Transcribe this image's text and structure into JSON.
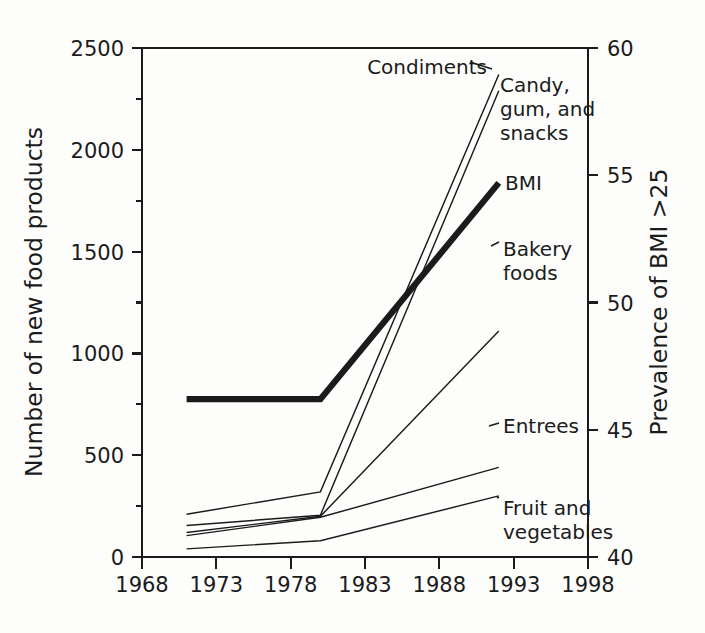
{
  "chart_data": {
    "type": "line",
    "title": "",
    "xlabel": "",
    "ylabel": "Number of new food products",
    "y2label": "Prevalence of BMI >25",
    "xlim": [
      1968,
      1998
    ],
    "ylim": [
      0,
      2500
    ],
    "y2lim": [
      40,
      60
    ],
    "grid": false,
    "legend_position": "inline-labels",
    "xticks": [
      1968,
      1973,
      1978,
      1983,
      1988,
      1993,
      1998
    ],
    "xtick_labels": [
      "1968",
      "1973",
      "1978",
      "1983",
      "1988",
      "1993",
      "1998"
    ],
    "yticks": [
      0,
      500,
      1000,
      1500,
      2000,
      2500
    ],
    "ytick_labels": [
      "0",
      "500",
      "1000",
      "1500",
      "2000",
      "2500"
    ],
    "yticks_minor": [
      250,
      750,
      1250,
      1750,
      2250
    ],
    "y2ticks": [
      40,
      45,
      50,
      55,
      60
    ],
    "y2tick_labels": [
      "40",
      "45",
      "50",
      "55",
      "60"
    ],
    "series": [
      {
        "name": "Condiments",
        "axis": "left",
        "label": "Condiments",
        "x": [
          1971,
          1980,
          1992
        ],
        "values": [
          210,
          320,
          2370
        ]
      },
      {
        "name": "Candy, gum, and snacks",
        "axis": "left",
        "label": "Candy,\ngum, and\nsnacks",
        "label_lines": [
          "Candy,",
          "gum, and",
          "snacks"
        ],
        "x": [
          1971,
          1980,
          1992
        ],
        "values": [
          155,
          205,
          2290
        ]
      },
      {
        "name": "BMI",
        "axis": "right",
        "label": "BMI",
        "x": [
          1971,
          1980,
          1992
        ],
        "values": [
          46.2,
          46.2,
          54.7
        ],
        "values_left_equivalent": [
          779,
          779,
          1840
        ],
        "emphasis": "bold"
      },
      {
        "name": "Bakery foods",
        "axis": "left",
        "label": "Bakery\nfoods",
        "label_lines": [
          "Bakery",
          "foods"
        ],
        "x": [
          1971,
          1980,
          1992
        ],
        "values": [
          120,
          200,
          1110
        ]
      },
      {
        "name": "Entrees",
        "axis": "left",
        "label": "Entrees",
        "x": [
          1971,
          1980,
          1992
        ],
        "values": [
          105,
          195,
          440
        ]
      },
      {
        "name": "Fruit and vegetables",
        "axis": "left",
        "label": "Fruit and\nvegetables",
        "label_lines": [
          "Fruit and",
          "vegetables"
        ],
        "x": [
          1971,
          1980,
          1992
        ],
        "values": [
          40,
          80,
          300
        ]
      }
    ]
  },
  "labels": {
    "y_left_title": "Number of new food products",
    "y_right_title": "Prevalence of BMI >25",
    "series_condiments": "Condiments",
    "series_candy_1": "Candy,",
    "series_candy_2": "gum, and",
    "series_candy_3": "snacks",
    "series_bmi": "BMI",
    "series_bakery_1": "Bakery",
    "series_bakery_2": "foods",
    "series_entrees": "Entrees",
    "series_fruit_1": "Fruit and",
    "series_fruit_2": "vegetables",
    "yt_0": "0",
    "yt_500": "500",
    "yt_1000": "1000",
    "yt_1500": "1500",
    "yt_2000": "2000",
    "yt_2500": "2500",
    "y2t_40": "40",
    "y2t_45": "45",
    "y2t_50": "50",
    "y2t_55": "55",
    "y2t_60": "60",
    "xt_1968": "1968",
    "xt_1973": "1973",
    "xt_1978": "1978",
    "xt_1983": "1983",
    "xt_1988": "1988",
    "xt_1993": "1993",
    "xt_1998": "1998"
  },
  "colors": {
    "ink": "#1b1b1b",
    "background": "#fdfdfb"
  }
}
